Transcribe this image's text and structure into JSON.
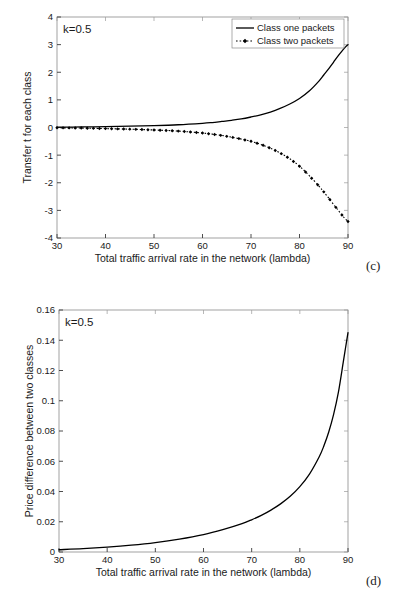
{
  "figure": {
    "subplots": [
      {
        "id": "c",
        "caption": "(c)",
        "annotation": "k=0.5"
      },
      {
        "id": "d",
        "caption": "(d)",
        "annotation": "k=0.5"
      }
    ]
  },
  "chart_data": [
    {
      "type": "line",
      "id": "c",
      "title": "",
      "xlabel": "Total traffic arrival rate in the network (lambda)",
      "ylabel": "Transfer t for each class",
      "annotation": "k=0.5",
      "caption": "(c)",
      "xlim": [
        30,
        90
      ],
      "ylim": [
        -4,
        4
      ],
      "xticks": [
        30,
        40,
        50,
        60,
        70,
        80,
        90
      ],
      "yticks": [
        -4,
        -3,
        -2,
        -1,
        0,
        1,
        2,
        3,
        4
      ],
      "xticklabels": [
        "30",
        "40",
        "50",
        "60",
        "70",
        "80",
        "90"
      ],
      "yticklabels": [
        "-4",
        "-3",
        "-2",
        "-1",
        "0",
        "1",
        "2",
        "3",
        "4"
      ],
      "grid": false,
      "legend": {
        "position": "top-right",
        "entries": [
          {
            "label": "Class one packets",
            "style": "solid",
            "marker": "none"
          },
          {
            "label": "Class two packets",
            "style": "dotted",
            "marker": "diamond"
          }
        ]
      },
      "series": [
        {
          "name": "Class one packets",
          "style": "solid",
          "color": "#000000",
          "x": [
            30,
            35,
            40,
            45,
            50,
            55,
            60,
            62,
            64,
            66,
            68,
            70,
            72,
            74,
            76,
            78,
            80,
            82,
            84,
            85,
            86,
            87,
            88,
            89,
            89.5,
            90
          ],
          "y": [
            0.01,
            0.02,
            0.03,
            0.05,
            0.07,
            0.1,
            0.15,
            0.18,
            0.22,
            0.26,
            0.31,
            0.38,
            0.46,
            0.56,
            0.69,
            0.85,
            1.05,
            1.32,
            1.68,
            1.9,
            2.12,
            2.36,
            2.6,
            2.82,
            2.92,
            3.0
          ]
        },
        {
          "name": "Class two packets",
          "style": "dotted",
          "color": "#000000",
          "x": [
            30,
            35,
            40,
            45,
            50,
            55,
            60,
            62,
            64,
            66,
            68,
            70,
            72,
            74,
            76,
            78,
            80,
            82,
            84,
            85,
            86,
            87,
            88,
            89,
            89.5,
            90
          ],
          "y": [
            -0.01,
            -0.02,
            -0.04,
            -0.06,
            -0.09,
            -0.13,
            -0.2,
            -0.24,
            -0.29,
            -0.35,
            -0.42,
            -0.5,
            -0.61,
            -0.75,
            -0.92,
            -1.13,
            -1.4,
            -1.74,
            -2.12,
            -2.33,
            -2.55,
            -2.78,
            -3.0,
            -3.22,
            -3.32,
            -3.4
          ]
        }
      ]
    },
    {
      "type": "line",
      "id": "d",
      "title": "",
      "xlabel": "Total traffic arrival rate in the network (lambda)",
      "ylabel": "Price difference between two classes",
      "annotation": "k=0.5",
      "caption": "(d)",
      "xlim": [
        30,
        90
      ],
      "ylim": [
        0,
        0.16
      ],
      "xticks": [
        30,
        40,
        50,
        60,
        70,
        80,
        90
      ],
      "yticks": [
        0,
        0.02,
        0.04,
        0.06,
        0.08,
        0.1,
        0.12,
        0.14,
        0.16
      ],
      "xticklabels": [
        "30",
        "40",
        "50",
        "60",
        "70",
        "80",
        "90"
      ],
      "yticklabels": [
        "0",
        "0.02",
        "0.04",
        "0.06",
        "0.08",
        "0.1",
        "0.12",
        "0.14",
        "0.16"
      ],
      "grid": false,
      "legend": null,
      "series": [
        {
          "name": "Price difference",
          "style": "solid",
          "color": "#000000",
          "x": [
            30,
            35,
            40,
            45,
            50,
            55,
            60,
            64,
            68,
            70,
            72,
            74,
            76,
            78,
            80,
            82,
            84,
            85,
            86,
            87,
            88,
            89,
            89.5,
            90
          ],
          "y": [
            0.0015,
            0.0022,
            0.0032,
            0.0045,
            0.0062,
            0.0085,
            0.0115,
            0.0148,
            0.0188,
            0.0213,
            0.0242,
            0.0277,
            0.0318,
            0.0368,
            0.0432,
            0.0515,
            0.0628,
            0.0702,
            0.0793,
            0.0908,
            0.1055,
            0.1252,
            0.1352,
            0.145
          ]
        }
      ]
    }
  ]
}
